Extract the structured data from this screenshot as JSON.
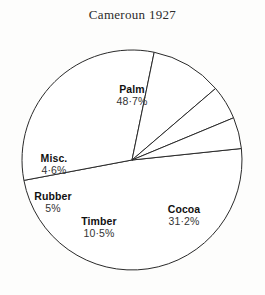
{
  "chart_data": {
    "type": "pie",
    "title": "Cameroun 1927",
    "categories": [
      "Palm",
      "Cocoa",
      "Timber",
      "Rubber",
      "Misc."
    ],
    "values": [
      48.7,
      31.2,
      10.5,
      5,
      4.6
    ],
    "value_labels": [
      "48·7%",
      "31·2%",
      "10·5%",
      "5%",
      "4·6%"
    ],
    "unit": "%",
    "total": 100,
    "legend": "none",
    "grid": false,
    "slice_fill": "#ffffff",
    "slice_stroke": "#2a2a2a",
    "slices": [
      {
        "name": "Palm",
        "value": 48.7,
        "label": "48·7%"
      },
      {
        "name": "Cocoa",
        "value": 31.2,
        "label": "31·2%"
      },
      {
        "name": "Timber",
        "value": 10.5,
        "label": "10·5%"
      },
      {
        "name": "Rubber",
        "value": 5,
        "label": "5%"
      },
      {
        "name": "Misc.",
        "value": 4.6,
        "label": "4·6%"
      }
    ]
  },
  "title": "Cameroun 1927",
  "labels": {
    "palm": {
      "name": "Palm",
      "percent": "48·7%"
    },
    "cocoa": {
      "name": "Cocoa",
      "percent": "31·2%"
    },
    "timber": {
      "name": "Timber",
      "percent": "10·5%"
    },
    "rubber": {
      "name": "Rubber",
      "percent": "5%"
    },
    "misc": {
      "name": "Misc.",
      "percent": "4·6%"
    }
  }
}
